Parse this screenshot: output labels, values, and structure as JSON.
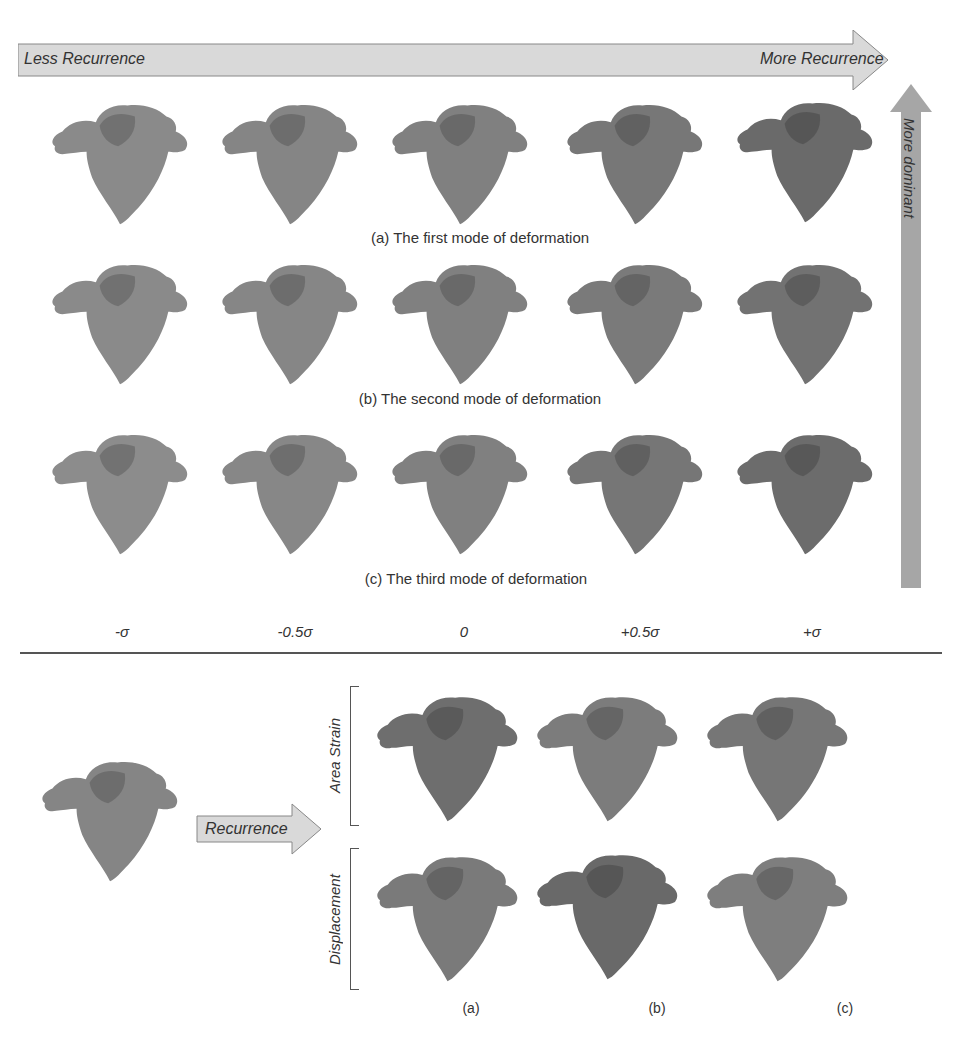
{
  "top_arrow": {
    "left_label": "Less Recurrence",
    "right_label": "More Recurrence",
    "color": "#d9d9d9"
  },
  "side_arrow": {
    "label": "More dominant",
    "color": "#a6a6a6"
  },
  "modes": [
    {
      "caption": "(a) The first mode of deformation",
      "shades": [
        "#8a8a8a",
        "#858585",
        "#808080",
        "#777777",
        "#6a6a6a"
      ]
    },
    {
      "caption": "(b) The second mode of deformation",
      "shades": [
        "#8a8a8a",
        "#868686",
        "#808080",
        "#7a7a7a",
        "#727272"
      ]
    },
    {
      "caption": "(c) The third mode of deformation",
      "shades": [
        "#8c8c8c",
        "#878787",
        "#808080",
        "#767676",
        "#6c6c6c"
      ]
    }
  ],
  "sigma_labels": [
    "-σ",
    "-0.5σ",
    "0",
    "+0.5σ",
    "+σ"
  ],
  "bottom": {
    "recurrence_label": "Recurrence",
    "row_labels": [
      "Area Strain",
      "Displacement"
    ],
    "column_labels": [
      "(a)",
      "(b)",
      "(c)"
    ]
  }
}
